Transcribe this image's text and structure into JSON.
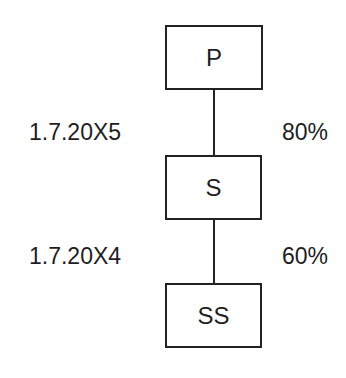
{
  "diagram": {
    "nodes": [
      {
        "id": "P",
        "label": "P"
      },
      {
        "id": "S",
        "label": "S"
      },
      {
        "id": "SS",
        "label": "SS"
      }
    ],
    "edges": [
      {
        "from": "P",
        "to": "S",
        "left_label": "1.7.20X5",
        "right_label": "80%"
      },
      {
        "from": "S",
        "to": "SS",
        "left_label": "1.7.20X4",
        "right_label": "60%"
      }
    ],
    "colors": {
      "stroke": "#222222",
      "text": "#1e1e1e",
      "background": "#ffffff"
    }
  }
}
